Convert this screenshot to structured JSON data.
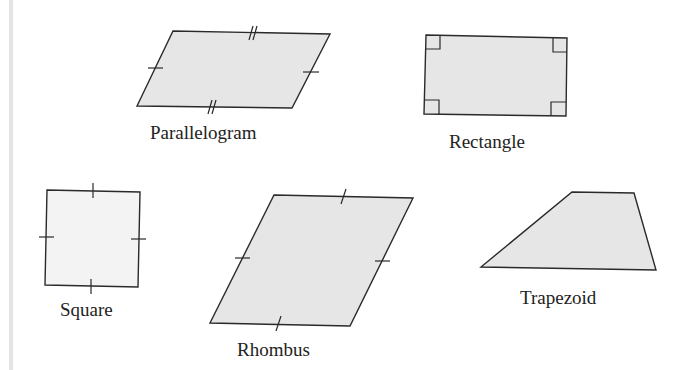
{
  "figure": {
    "shapes": [
      {
        "id": "parallelogram",
        "label": "Parallelogram",
        "markings": "opposite sides congruent (single and double tick marks)"
      },
      {
        "id": "rectangle",
        "label": "Rectangle",
        "markings": "four right-angle markers"
      },
      {
        "id": "square",
        "label": "Square",
        "markings": "four congruent sides (single tick marks), right angles"
      },
      {
        "id": "rhombus",
        "label": "Rhombus",
        "markings": "four congruent sides (single tick marks)"
      },
      {
        "id": "trapezoid",
        "label": "Trapezoid",
        "markings": "one pair of parallel sides"
      }
    ],
    "colors": {
      "shape_fill": "#e6e6e6",
      "square_fill": "#f3f3f3",
      "stroke": "#2a2a2a",
      "background": "#ffffff"
    }
  }
}
